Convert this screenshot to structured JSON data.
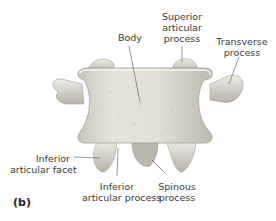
{
  "panel_label": "(b)",
  "labels": {
    "body": "Body",
    "superior_articular_process": [
      "Superior",
      "articular",
      "process"
    ],
    "transverse_process": [
      "Transverse",
      "process"
    ],
    "inferior_articular_facet": [
      "Inferior",
      "articular facet"
    ],
    "inferior_articular_process": [
      "Inferior",
      "articular process"
    ],
    "spinous_process": [
      "Spinous",
      "process"
    ]
  },
  "colors": {
    "bone_light": "#e9e7e0",
    "bone_mid": "#cfcbc1",
    "bone_shadow": "#9e9a90",
    "leader_line": "#555555",
    "text": "#3a3a3a"
  }
}
